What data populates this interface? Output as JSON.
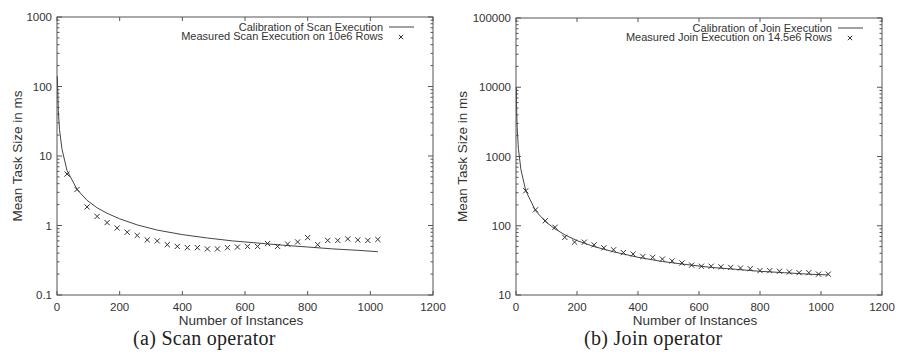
{
  "chart_data": [
    {
      "type": "line",
      "caption": "(a) Scan operator",
      "title": "",
      "xlabel": "Number of Instances",
      "ylabel": "Mean Task Size in ms",
      "xscale": "linear",
      "yscale": "log",
      "xlim": [
        0,
        1200
      ],
      "ylim": [
        0.1,
        1000
      ],
      "xticks": [
        0,
        200,
        400,
        600,
        800,
        1000,
        1200
      ],
      "yticks": [
        0.1,
        1,
        10,
        100,
        1000
      ],
      "ytick_labels": [
        "0.1",
        "1",
        "10",
        "100",
        "1000"
      ],
      "grid": false,
      "legend_position": "top-right",
      "series": [
        {
          "name": "Calibration of Scan Execution",
          "style": "line",
          "x": [
            1,
            4,
            8,
            16,
            32,
            64,
            96,
            128,
            160,
            200,
            256,
            320,
            400,
            480,
            560,
            640,
            720,
            800,
            880,
            960,
            1024
          ],
          "values": [
            140,
            45,
            24,
            12.5,
            6.2,
            3.3,
            2.3,
            1.8,
            1.5,
            1.25,
            1.02,
            0.86,
            0.74,
            0.66,
            0.6,
            0.56,
            0.52,
            0.49,
            0.46,
            0.44,
            0.42
          ]
        },
        {
          "name": "Measured Scan Execution on 10e6 Rows",
          "style": "markers",
          "marker": "x",
          "x": [
            32,
            64,
            96,
            128,
            160,
            192,
            224,
            256,
            288,
            320,
            352,
            384,
            416,
            448,
            480,
            512,
            544,
            576,
            608,
            640,
            672,
            704,
            736,
            768,
            800,
            832,
            864,
            896,
            928,
            960,
            992,
            1024
          ],
          "values": [
            5.5,
            3.3,
            1.85,
            1.35,
            1.1,
            0.92,
            0.8,
            0.72,
            0.62,
            0.6,
            0.53,
            0.5,
            0.48,
            0.48,
            0.46,
            0.46,
            0.48,
            0.49,
            0.5,
            0.5,
            0.55,
            0.5,
            0.54,
            0.58,
            0.67,
            0.53,
            0.61,
            0.61,
            0.64,
            0.62,
            0.61,
            0.63
          ]
        }
      ]
    },
    {
      "type": "line",
      "caption": "(b) Join operator",
      "title": "",
      "xlabel": "Number of Instances",
      "ylabel": "Mean Task Size in ms",
      "xscale": "linear",
      "yscale": "log",
      "xlim": [
        0,
        1200
      ],
      "ylim": [
        10,
        100000
      ],
      "xticks": [
        0,
        200,
        400,
        600,
        800,
        1000,
        1200
      ],
      "yticks": [
        10,
        100,
        1000,
        10000,
        100000
      ],
      "ytick_labels": [
        "10",
        "100",
        "1000",
        "10000",
        "100000"
      ],
      "grid": false,
      "legend_position": "top-right",
      "series": [
        {
          "name": "Calibration of Join Execution",
          "style": "line",
          "x": [
            1,
            2,
            4,
            8,
            16,
            32,
            64,
            96,
            128,
            160,
            200,
            256,
            320,
            400,
            480,
            560,
            640,
            720,
            800,
            880,
            960,
            1024
          ],
          "values": [
            10000,
            5000,
            2600,
            1300,
            650,
            320,
            165,
            115,
            90,
            74,
            61,
            50,
            42,
            35,
            30.5,
            27.5,
            25,
            23.5,
            22,
            21,
            20,
            19.5
          ]
        },
        {
          "name": "Measured Join Execution on 14.5e6 Rows",
          "style": "markers",
          "marker": "x",
          "x": [
            32,
            64,
            96,
            128,
            160,
            192,
            224,
            256,
            288,
            320,
            352,
            384,
            416,
            448,
            480,
            512,
            544,
            576,
            608,
            640,
            672,
            704,
            736,
            768,
            800,
            832,
            864,
            896,
            928,
            960,
            992,
            1024
          ],
          "values": [
            320,
            170,
            118,
            95,
            68,
            58,
            58,
            53,
            48,
            45,
            41,
            39,
            36,
            35,
            33,
            31,
            29,
            27,
            26,
            26,
            25.5,
            25,
            24.5,
            24,
            22.5,
            22.5,
            22,
            21.5,
            21,
            21,
            20,
            20
          ]
        }
      ]
    }
  ],
  "panels": {
    "a": {
      "caption": "(a) Scan operator"
    },
    "b": {
      "caption": "(b) Join operator"
    }
  }
}
